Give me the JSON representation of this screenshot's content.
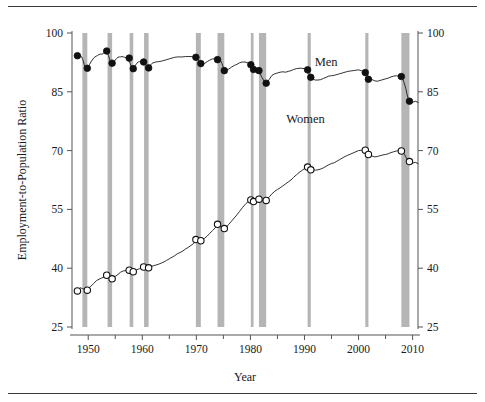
{
  "figure": {
    "top_rule": true,
    "bottom_rule": true
  },
  "chart_data": {
    "type": "line",
    "title": "",
    "xlabel": "Year",
    "ylabel": "Employment-to-Population Ratio",
    "xlim": [
      1947.0,
      2011.0
    ],
    "ylim": [
      25,
      100
    ],
    "xticks": [
      1950,
      1960,
      1970,
      1980,
      1990,
      2000,
      2010
    ],
    "xticklabels": [
      "1950",
      "1960",
      "1970",
      "1980",
      "1990",
      "2000",
      "2010"
    ],
    "xminorticks": [
      1955,
      1965,
      1975,
      1985,
      1995,
      2005
    ],
    "yticks": [
      25,
      40,
      55,
      70,
      85,
      100
    ],
    "yticklabels": [
      "25",
      "40",
      "55",
      "70",
      "85",
      "100"
    ],
    "right_axis": true,
    "right_yticks": [
      25,
      40,
      55,
      70,
      85,
      100
    ],
    "right_yticklabels": [
      "25",
      "40",
      "55",
      "70",
      "85",
      "100"
    ],
    "grid": false,
    "legend_position": "inline-annotation",
    "annotations": [
      {
        "name": "men-label",
        "text": "Men",
        "x": 1994.0,
        "y": 91.6
      },
      {
        "name": "women-label",
        "text": "Women",
        "x": 1990.2,
        "y": 77.0
      }
    ],
    "shaded_regions": {
      "name": "recession-bands",
      "label": "NBER recessions",
      "color": "#b5b5b5",
      "spans": [
        [
          1948.92,
          1949.83
        ],
        [
          1953.58,
          1954.42
        ],
        [
          1957.67,
          1958.33
        ],
        [
          1960.33,
          1961.17
        ],
        [
          1969.92,
          1970.83
        ],
        [
          1973.92,
          1975.17
        ],
        [
          1980.08,
          1980.58
        ],
        [
          1981.58,
          1982.92
        ],
        [
          1990.58,
          1991.17
        ],
        [
          2001.25,
          2001.83
        ],
        [
          2007.92,
          2009.42
        ]
      ]
    },
    "series": [
      {
        "name": "Men",
        "marker": "filled-circle",
        "color": "#111111",
        "x": [
          1948.0,
          1948.25,
          1948.5,
          1948.75,
          1949.0,
          1949.25,
          1949.5,
          1949.75,
          1950.0,
          1950.25,
          1950.5,
          1950.75,
          1951.0,
          1951.25,
          1951.5,
          1951.75,
          1952.0,
          1952.25,
          1952.5,
          1952.75,
          1953.0,
          1953.25,
          1953.5,
          1953.75,
          1954.0,
          1954.25,
          1954.5,
          1954.75,
          1955.0,
          1955.25,
          1955.5,
          1955.75,
          1956.0,
          1956.25,
          1956.5,
          1956.75,
          1957.0,
          1957.25,
          1957.5,
          1957.75,
          1958.0,
          1958.25,
          1958.5,
          1958.75,
          1959.0,
          1959.25,
          1959.5,
          1959.75,
          1960.0,
          1960.25,
          1960.5,
          1960.75,
          1961.0,
          1961.25,
          1961.5,
          1961.75,
          1962.0,
          1962.5,
          1963.0,
          1963.5,
          1964.0,
          1964.5,
          1965.0,
          1965.5,
          1966.0,
          1966.5,
          1967.0,
          1967.5,
          1968.0,
          1968.5,
          1969.0,
          1969.5,
          1970.0,
          1970.25,
          1970.5,
          1970.75,
          1971.0,
          1971.5,
          1972.0,
          1972.5,
          1973.0,
          1973.5,
          1974.0,
          1974.25,
          1974.5,
          1974.75,
          1975.0,
          1975.25,
          1975.5,
          1976.0,
          1976.5,
          1977.0,
          1977.5,
          1978.0,
          1978.5,
          1979.0,
          1979.5,
          1980.0,
          1980.25,
          1980.5,
          1980.75,
          1981.0,
          1981.5,
          1981.75,
          1982.0,
          1982.5,
          1982.75,
          1983.0,
          1983.5,
          1984.0,
          1984.5,
          1985.0,
          1985.5,
          1986.0,
          1986.5,
          1987.0,
          1987.5,
          1988.0,
          1988.5,
          1989.0,
          1989.5,
          1990.0,
          1990.5,
          1990.75,
          1991.0,
          1991.25,
          1991.5,
          1992.0,
          1992.5,
          1993.0,
          1993.5,
          1994.0,
          1994.5,
          1995.0,
          1995.5,
          1996.0,
          1996.5,
          1997.0,
          1997.5,
          1998.0,
          1998.5,
          1999.0,
          1999.5,
          2000.0,
          2000.5,
          2001.0,
          2001.25,
          2001.5,
          2001.75,
          2002.0,
          2002.5,
          2003.0,
          2003.5,
          2004.0,
          2004.5,
          2005.0,
          2005.5,
          2006.0,
          2006.5,
          2007.0,
          2007.5,
          2007.92,
          2008.25,
          2008.5,
          2008.75,
          2009.0,
          2009.25,
          2009.5,
          2009.75,
          2010.0,
          2010.5,
          2011.0
        ],
        "y": [
          94.2,
          94.6,
          94.3,
          94.0,
          93.2,
          92.0,
          91.2,
          91.0,
          91.3,
          92.0,
          92.6,
          93.1,
          93.6,
          93.9,
          94.1,
          94.3,
          94.5,
          94.6,
          94.6,
          94.7,
          95.1,
          95.4,
          95.0,
          94.2,
          93.1,
          92.5,
          92.3,
          92.6,
          93.1,
          93.5,
          93.8,
          93.9,
          93.9,
          94.0,
          93.9,
          93.8,
          93.7,
          93.4,
          93.0,
          92.3,
          91.3,
          90.8,
          91.1,
          91.8,
          92.3,
          92.6,
          92.7,
          92.6,
          92.6,
          92.5,
          92.2,
          91.7,
          91.1,
          91.3,
          91.8,
          92.2,
          92.4,
          92.6,
          92.7,
          92.8,
          93.0,
          93.2,
          93.4,
          93.6,
          93.8,
          93.9,
          93.9,
          93.9,
          94.0,
          94.0,
          94.0,
          93.9,
          93.6,
          93.2,
          92.7,
          92.3,
          92.0,
          92.2,
          92.7,
          93.1,
          93.4,
          93.4,
          93.3,
          93.2,
          92.9,
          92.2,
          91.2,
          90.6,
          90.4,
          90.8,
          91.3,
          91.7,
          92.0,
          92.4,
          92.6,
          92.6,
          92.4,
          92.0,
          91.5,
          90.8,
          90.6,
          90.7,
          90.4,
          89.9,
          89.0,
          87.8,
          87.2,
          87.4,
          88.2,
          89.2,
          89.6,
          89.8,
          90.0,
          90.1,
          90.0,
          90.2,
          90.4,
          90.7,
          90.9,
          91.0,
          91.0,
          90.9,
          90.4,
          89.9,
          89.2,
          88.6,
          88.2,
          88.0,
          88.0,
          88.1,
          88.4,
          88.7,
          89.0,
          89.1,
          89.2,
          89.4,
          89.6,
          89.8,
          90.0,
          90.2,
          90.3,
          90.4,
          90.5,
          90.6,
          90.4,
          90.0,
          89.8,
          89.4,
          89.0,
          88.6,
          88.1,
          87.8,
          87.7,
          87.9,
          88.1,
          88.3,
          88.5,
          88.8,
          89.0,
          89.1,
          89.0,
          88.9,
          88.0,
          87.0,
          85.8,
          84.2,
          83.0,
          82.4,
          82.2,
          82.3,
          82.6,
          82.3
        ],
        "markers": [
          {
            "x": 1948.0,
            "y": 94.2,
            "label": "peak"
          },
          {
            "x": 1949.83,
            "y": 91.0,
            "label": "trough"
          },
          {
            "x": 1953.42,
            "y": 95.4,
            "label": "peak"
          },
          {
            "x": 1954.42,
            "y": 92.3,
            "label": "trough"
          },
          {
            "x": 1957.58,
            "y": 93.6,
            "label": "peak"
          },
          {
            "x": 1958.33,
            "y": 90.9,
            "label": "trough"
          },
          {
            "x": 1960.25,
            "y": 92.6,
            "label": "peak"
          },
          {
            "x": 1961.17,
            "y": 91.1,
            "label": "trough"
          },
          {
            "x": 1969.92,
            "y": 93.8,
            "label": "peak"
          },
          {
            "x": 1970.83,
            "y": 92.2,
            "label": "trough"
          },
          {
            "x": 1973.92,
            "y": 93.2,
            "label": "peak"
          },
          {
            "x": 1975.17,
            "y": 90.4,
            "label": "trough"
          },
          {
            "x": 1980.08,
            "y": 91.9,
            "label": "peak"
          },
          {
            "x": 1980.58,
            "y": 90.7,
            "label": "trough"
          },
          {
            "x": 1981.58,
            "y": 90.4,
            "label": "peak"
          },
          {
            "x": 1982.92,
            "y": 87.2,
            "label": "trough"
          },
          {
            "x": 1990.58,
            "y": 90.6,
            "label": "peak"
          },
          {
            "x": 1991.17,
            "y": 88.7,
            "label": "trough"
          },
          {
            "x": 2001.25,
            "y": 89.9,
            "label": "peak"
          },
          {
            "x": 2001.83,
            "y": 88.2,
            "label": "trough"
          },
          {
            "x": 2007.92,
            "y": 88.9,
            "label": "peak"
          },
          {
            "x": 2009.42,
            "y": 82.6,
            "label": "trough"
          }
        ]
      },
      {
        "name": "Women",
        "marker": "open-circle",
        "color": "#111111",
        "x": [
          1948.0,
          1948.25,
          1948.5,
          1948.75,
          1949.0,
          1949.25,
          1949.5,
          1949.83,
          1950.0,
          1950.5,
          1951.0,
          1951.5,
          1952.0,
          1952.5,
          1953.0,
          1953.42,
          1953.75,
          1954.0,
          1954.42,
          1954.75,
          1955.0,
          1955.5,
          1956.0,
          1956.5,
          1957.0,
          1957.58,
          1958.0,
          1958.33,
          1958.75,
          1959.0,
          1959.5,
          1960.0,
          1960.25,
          1960.75,
          1961.17,
          1961.5,
          1962.0,
          1962.5,
          1963.0,
          1963.5,
          1964.0,
          1964.5,
          1965.0,
          1965.5,
          1966.0,
          1966.5,
          1967.0,
          1967.5,
          1968.0,
          1968.5,
          1969.0,
          1969.5,
          1969.92,
          1970.25,
          1970.5,
          1970.83,
          1971.0,
          1971.5,
          1972.0,
          1972.5,
          1973.0,
          1973.5,
          1973.92,
          1974.25,
          1974.5,
          1974.75,
          1975.17,
          1975.5,
          1976.0,
          1976.5,
          1977.0,
          1977.5,
          1978.0,
          1978.5,
          1979.0,
          1979.5,
          1980.08,
          1980.33,
          1980.58,
          1981.0,
          1981.58,
          1982.0,
          1982.5,
          1982.92,
          1983.0,
          1983.5,
          1984.0,
          1984.5,
          1985.0,
          1985.5,
          1986.0,
          1986.5,
          1987.0,
          1987.5,
          1988.0,
          1988.5,
          1989.0,
          1989.5,
          1990.0,
          1990.58,
          1990.83,
          1991.17,
          1991.5,
          1992.0,
          1992.5,
          1993.0,
          1993.5,
          1994.0,
          1994.5,
          1995.0,
          1995.5,
          1996.0,
          1996.5,
          1997.0,
          1997.5,
          1998.0,
          1998.5,
          1999.0,
          1999.5,
          2000.0,
          2000.5,
          2001.0,
          2001.25,
          2001.5,
          2001.83,
          2002.0,
          2002.5,
          2003.0,
          2003.5,
          2004.0,
          2004.5,
          2005.0,
          2005.5,
          2006.0,
          2006.5,
          2007.0,
          2007.5,
          2007.92,
          2008.25,
          2008.5,
          2008.75,
          2009.0,
          2009.42,
          2009.75,
          2010.0,
          2010.5,
          2011.0
        ],
        "y": [
          34.2,
          34.6,
          35.0,
          34.9,
          34.8,
          34.6,
          34.5,
          34.4,
          34.8,
          35.4,
          36.1,
          36.8,
          37.2,
          37.5,
          37.8,
          38.2,
          38.0,
          37.7,
          37.3,
          37.6,
          37.9,
          38.4,
          39.0,
          39.3,
          39.4,
          39.5,
          39.3,
          39.1,
          39.4,
          39.6,
          39.9,
          40.1,
          40.3,
          40.2,
          40.1,
          40.3,
          40.6,
          40.8,
          41.0,
          41.3,
          41.6,
          42.0,
          42.4,
          42.8,
          43.2,
          43.7,
          44.0,
          44.4,
          44.9,
          45.3,
          45.8,
          46.3,
          47.3,
          47.1,
          46.9,
          47.0,
          47.2,
          47.6,
          48.2,
          48.9,
          49.6,
          50.3,
          51.2,
          50.9,
          50.5,
          50.2,
          50.1,
          50.4,
          51.2,
          52.0,
          52.8,
          53.6,
          54.5,
          55.4,
          56.2,
          56.9,
          57.4,
          57.2,
          57.0,
          57.2,
          57.6,
          57.4,
          57.2,
          57.3,
          57.6,
          58.2,
          59.0,
          59.6,
          60.1,
          60.5,
          61.0,
          61.5,
          62.0,
          62.5,
          63.2,
          63.8,
          64.4,
          64.9,
          65.4,
          65.8,
          65.6,
          65.3,
          65.1,
          65.0,
          65.1,
          65.3,
          65.6,
          66.0,
          66.4,
          66.7,
          66.9,
          67.3,
          67.7,
          68.1,
          68.5,
          68.8,
          69.1,
          69.4,
          69.7,
          70.0,
          70.1,
          69.9,
          69.7,
          69.4,
          69.0,
          68.9,
          68.6,
          68.4,
          68.5,
          68.7,
          68.9,
          69.0,
          69.2,
          69.5,
          69.7,
          69.9,
          70.0,
          69.9,
          69.5,
          69.0,
          68.4,
          67.8,
          67.2,
          66.9,
          66.8,
          67.0,
          66.7
        ],
        "markers": [
          {
            "x": 1948.0,
            "y": 34.2,
            "label": "peak"
          },
          {
            "x": 1949.83,
            "y": 34.4,
            "label": "trough"
          },
          {
            "x": 1953.42,
            "y": 38.2,
            "label": "peak"
          },
          {
            "x": 1954.42,
            "y": 37.3,
            "label": "trough"
          },
          {
            "x": 1957.58,
            "y": 39.5,
            "label": "peak"
          },
          {
            "x": 1958.33,
            "y": 39.1,
            "label": "trough"
          },
          {
            "x": 1960.25,
            "y": 40.3,
            "label": "peak"
          },
          {
            "x": 1961.17,
            "y": 40.1,
            "label": "trough"
          },
          {
            "x": 1969.92,
            "y": 47.3,
            "label": "peak"
          },
          {
            "x": 1970.83,
            "y": 47.0,
            "label": "trough"
          },
          {
            "x": 1973.92,
            "y": 51.2,
            "label": "peak"
          },
          {
            "x": 1975.17,
            "y": 50.1,
            "label": "trough"
          },
          {
            "x": 1980.08,
            "y": 57.4,
            "label": "peak"
          },
          {
            "x": 1980.58,
            "y": 57.0,
            "label": "trough"
          },
          {
            "x": 1981.58,
            "y": 57.6,
            "label": "peak"
          },
          {
            "x": 1982.92,
            "y": 57.3,
            "label": "trough"
          },
          {
            "x": 1990.58,
            "y": 65.8,
            "label": "peak"
          },
          {
            "x": 1991.17,
            "y": 65.1,
            "label": "trough"
          },
          {
            "x": 2001.25,
            "y": 70.1,
            "label": "peak"
          },
          {
            "x": 2001.83,
            "y": 69.0,
            "label": "trough"
          },
          {
            "x": 2007.92,
            "y": 69.9,
            "label": "peak"
          },
          {
            "x": 2009.42,
            "y": 67.2,
            "label": "trough"
          }
        ]
      }
    ]
  }
}
